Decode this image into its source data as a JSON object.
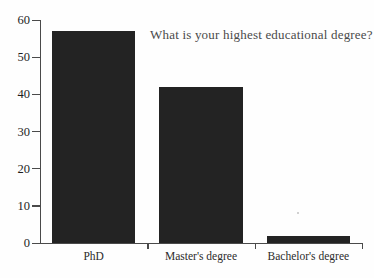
{
  "chart_data": {
    "type": "bar",
    "title": "What is your highest educational degree?",
    "xlabel": "",
    "ylabel": "",
    "categories": [
      "PhD",
      "Master's degree",
      "Bachelor's degree"
    ],
    "values": [
      57,
      42,
      2
    ],
    "ylim": [
      0,
      60
    ],
    "yticks": [
      0,
      10,
      20,
      30,
      40,
      50,
      60
    ],
    "ytick_labels": [
      "0",
      "10",
      "20",
      "30",
      "40",
      "50",
      "60"
    ],
    "grid": false,
    "legend": null,
    "orientation": "vertical",
    "bar_color": "#232323",
    "background_color": "#ffffff",
    "axis_color": "#4a4a4a",
    "title_color": "#4a4a4a",
    "title_position": "inside-upper-right"
  }
}
